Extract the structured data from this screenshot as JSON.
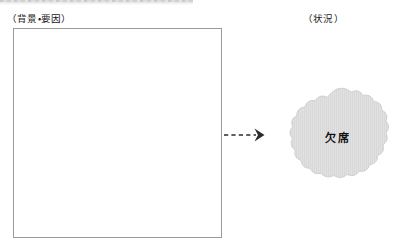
{
  "page": {
    "background": "#ffffff"
  },
  "scan_artifact": {
    "name": "cropped-table-header-band",
    "color": "#cfcfcf"
  },
  "columns": {
    "cause": {
      "caption": "（背景・要因）",
      "box": {
        "value": "",
        "placeholder": "",
        "border_color": "#9a9a9a",
        "fill_color": "#ffffff"
      }
    },
    "situation": {
      "caption": "（状況）",
      "burst": {
        "label": "欠席",
        "fill_color": "#d8d8d8",
        "edge_color": "#c8c8c8",
        "lobes": 18
      }
    }
  },
  "connector": {
    "name": "dashed-arrow",
    "direction": "right",
    "style": "dashed",
    "color": "#2b2b2b"
  }
}
